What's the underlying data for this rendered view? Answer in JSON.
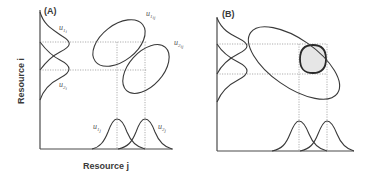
{
  "panels": [
    {
      "id": "A",
      "label": "(A)",
      "curve_labels": {
        "u1i": "u",
        "u1i_sub": "1",
        "u1i_sub2": "i",
        "u2i": "u",
        "u2i_sub": "2",
        "u2i_sub2": "i",
        "u1ij": "u",
        "u1ij_sub": "1",
        "u1ij_sub2": "ij",
        "u2ij": "u",
        "u2ij_sub": "2",
        "u2ij_sub2": "ij",
        "u1j": "u",
        "u1j_sub": "1",
        "u1j_sub2": "j",
        "u2j": "u",
        "u2j_sub": "2",
        "u2j_sub2": "j"
      },
      "x_axis_label": "Resource  j",
      "y_axis_label": "Resource  i"
    },
    {
      "id": "B",
      "label": "(B)",
      "overlap_fill": "#e6e6e6"
    }
  ],
  "colors": {
    "line": "#3a3a3a",
    "dotted": "#8a8a8a",
    "overlap": "#e6e6e6"
  }
}
